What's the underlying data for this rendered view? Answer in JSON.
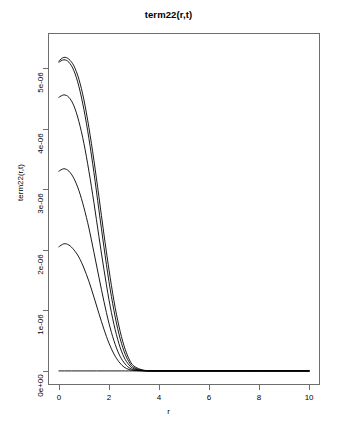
{
  "chart_data": {
    "type": "line",
    "title": "term22(r,t)",
    "xlabel": "r",
    "ylabel": "term22(r,t)",
    "xlim": [
      0,
      10
    ],
    "ylim": [
      0,
      5.35e-06
    ],
    "xticks": [
      0,
      2,
      4,
      6,
      8,
      10
    ],
    "xtick_labels": [
      "0",
      "2",
      "4",
      "6",
      "8",
      "10"
    ],
    "yticks": [
      0,
      1e-06,
      2e-06,
      3e-06,
      4e-06,
      5e-06
    ],
    "ytick_labels": [
      "0e+00",
      "1e-06",
      "2e-06",
      "3e-06",
      "4e-06",
      "5e-06"
    ],
    "grid": false,
    "legend": "none",
    "line_color": "#000000",
    "series": [
      {
        "name": "curve-1-baseline",
        "x": [
          0.0,
          0.5,
          1.0,
          1.5,
          2.0,
          2.5,
          3.0,
          4.0,
          5.0,
          6.0,
          7.0,
          8.0,
          9.0,
          10.0
        ],
        "values": [
          0,
          0,
          0,
          0,
          0,
          0,
          0,
          0,
          0,
          0,
          0,
          0,
          0,
          0
        ]
      },
      {
        "name": "curve-2",
        "x": [
          0.0,
          0.2,
          0.4,
          0.6,
          0.8,
          1.0,
          1.2,
          1.4,
          1.6,
          1.8,
          2.0,
          2.2,
          2.4,
          2.6,
          2.8,
          3.0,
          3.4,
          4.0,
          5.0,
          7.0,
          10.0
        ],
        "values": [
          2.05e-06,
          2.1e-06,
          2.08e-06,
          2e-06,
          1.88e-06,
          1.7e-06,
          1.48e-06,
          1.22e-06,
          9.5e-07,
          6.9e-07,
          4.6e-07,
          2.8e-07,
          1.5e-07,
          6.5e-08,
          2.4e-08,
          8e-09,
          1e-09,
          0,
          0,
          0,
          0
        ]
      },
      {
        "name": "curve-3",
        "x": [
          0.0,
          0.2,
          0.4,
          0.6,
          0.8,
          1.0,
          1.2,
          1.4,
          1.6,
          1.8,
          2.0,
          2.2,
          2.4,
          2.6,
          2.8,
          3.0,
          3.4,
          4.0,
          5.0,
          7.0,
          10.0
        ],
        "values": [
          3.3e-06,
          3.34e-06,
          3.3e-06,
          3.18e-06,
          2.98e-06,
          2.7e-06,
          2.36e-06,
          1.96e-06,
          1.55e-06,
          1.15e-06,
          7.9e-07,
          5e-07,
          2.8e-07,
          1.4e-07,
          5.5e-08,
          1.8e-08,
          2e-09,
          0,
          0,
          0,
          0
        ]
      },
      {
        "name": "curve-4",
        "x": [
          0.0,
          0.2,
          0.4,
          0.6,
          0.8,
          1.0,
          1.2,
          1.4,
          1.6,
          1.8,
          2.0,
          2.2,
          2.4,
          2.6,
          2.8,
          3.0,
          3.4,
          4.0,
          5.0,
          7.0,
          10.0
        ],
        "values": [
          4.52e-06,
          4.56e-06,
          4.52e-06,
          4.38e-06,
          4.12e-06,
          3.76e-06,
          3.3e-06,
          2.78e-06,
          2.22e-06,
          1.68e-06,
          1.18e-06,
          7.7e-07,
          4.5e-07,
          2.3e-07,
          1e-07,
          3.5e-08,
          4e-09,
          0,
          0,
          0,
          0
        ]
      },
      {
        "name": "curve-5",
        "x": [
          0.0,
          0.2,
          0.4,
          0.6,
          0.8,
          1.0,
          1.2,
          1.4,
          1.6,
          1.8,
          2.0,
          2.2,
          2.4,
          2.6,
          2.8,
          3.0,
          3.4,
          4.0,
          5.0,
          7.0,
          10.0
        ],
        "values": [
          5.1e-06,
          5.14e-06,
          5.1e-06,
          4.96e-06,
          4.7e-06,
          4.32e-06,
          3.84e-06,
          3.28e-06,
          2.66e-06,
          2.05e-06,
          1.48e-06,
          1e-06,
          6.1e-07,
          3.3e-07,
          1.5e-07,
          5.5e-08,
          7e-09,
          0,
          0,
          0,
          0
        ]
      },
      {
        "name": "curve-6",
        "x": [
          0.0,
          0.2,
          0.4,
          0.6,
          0.8,
          1.0,
          1.2,
          1.4,
          1.6,
          1.8,
          2.0,
          2.2,
          2.4,
          2.6,
          2.8,
          3.0,
          3.4,
          4.0,
          5.0,
          7.0,
          10.0
        ],
        "values": [
          5.12e-06,
          5.18e-06,
          5.15e-06,
          5.04e-06,
          4.82e-06,
          4.48e-06,
          4.02e-06,
          3.48e-06,
          2.88e-06,
          2.26e-06,
          1.68e-06,
          1.16e-06,
          7.4e-07,
          4.2e-07,
          2e-07,
          8e-08,
          1.1e-08,
          0,
          0,
          0,
          0
        ]
      }
    ]
  }
}
